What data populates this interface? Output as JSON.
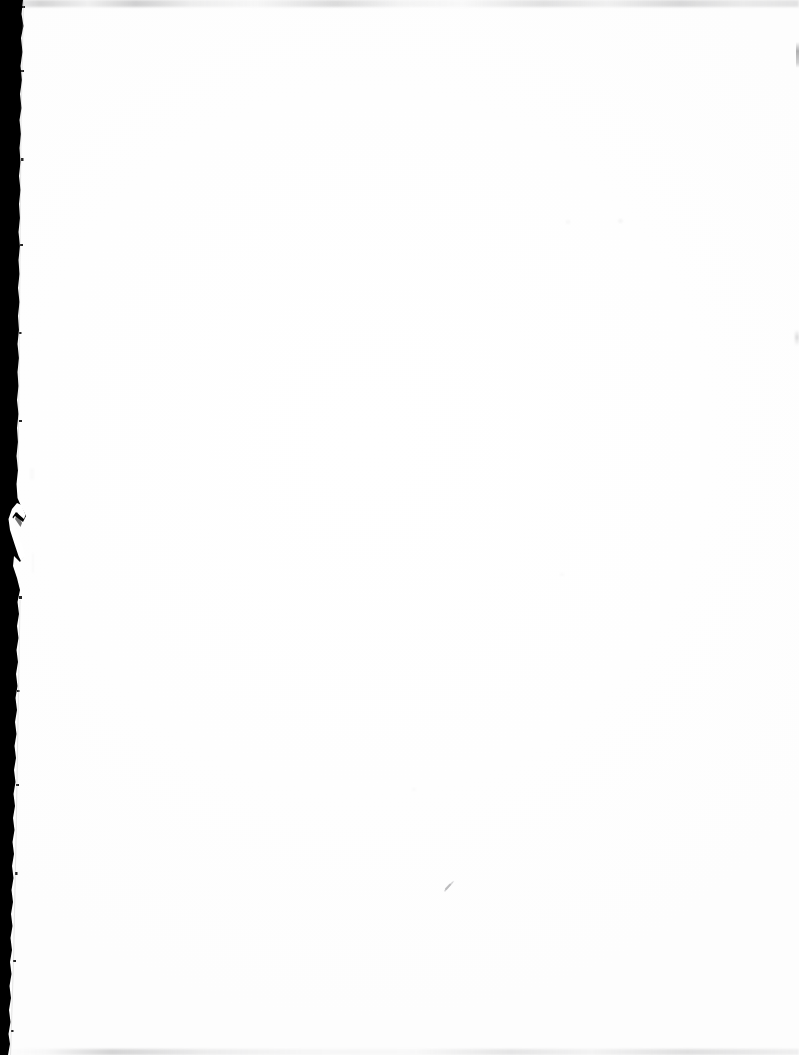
{
  "document": {
    "kind": "scanned-page",
    "page_content": "",
    "page_text_visible": "none",
    "description_label": "Blank scanned page",
    "page_width_px": 799,
    "page_height_px": 1055
  },
  "colors": {
    "paper": "#ffffff",
    "paper_shade": "#fdfdfd",
    "scan_border": "#000000",
    "edge_smudge": "#78787a",
    "pencil_mark": "#8a8a8d"
  },
  "artifacts": {
    "left_scan_border": {
      "name": "scanner-bed-black-border",
      "edge": "left",
      "approx_width_px": 20,
      "notes": "irregular torn edge, narrows toward the bottom of the page"
    },
    "top_edge_smudge": {
      "name": "top-edge-grey-smudge",
      "edge": "top",
      "approx_height_px": 6
    },
    "bottom_edge_smudge": {
      "name": "bottom-edge-grey-smudge",
      "edge": "bottom",
      "approx_height_px": 5
    },
    "right_edge_marks": {
      "name": "right-edge-vertical-marks",
      "edge": "right",
      "count": 2
    },
    "pencil_speck": {
      "name": "pencil-speck",
      "approx_x_px": 450,
      "approx_y_px": 886,
      "approx_size_px": 10
    }
  }
}
